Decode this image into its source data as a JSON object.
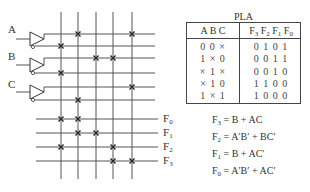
{
  "diagram": {
    "inputs": [
      {
        "name": "A",
        "label_x": 8,
        "label_y": 24,
        "line_y": 39,
        "true_y": 34,
        "comp_y": 46
      },
      {
        "name": "B",
        "label_x": 8,
        "label_y": 51,
        "line_y": 65,
        "true_y": 58,
        "comp_y": 73
      },
      {
        "name": "C",
        "label_x": 8,
        "label_y": 79,
        "line_y": 92,
        "true_y": 87,
        "comp_y": 100
      }
    ],
    "product_line_x": [
      61,
      78,
      96,
      113,
      132
    ],
    "input_line_ys": [
      34,
      46,
      58,
      73,
      87,
      100
    ],
    "and_crosses": [
      {
        "x": 78,
        "y": 34
      },
      {
        "x": 132,
        "y": 34
      },
      {
        "x": 61,
        "y": 46
      },
      {
        "x": 96,
        "y": 58
      },
      {
        "x": 113,
        "y": 58
      },
      {
        "x": 61,
        "y": 73
      },
      {
        "x": 132,
        "y": 87
      },
      {
        "x": 78,
        "y": 100
      }
    ],
    "outputs": [
      {
        "name": "F0",
        "base": "F",
        "sub": "0",
        "y": 119
      },
      {
        "name": "F1",
        "base": "F",
        "sub": "1",
        "y": 133
      },
      {
        "name": "F2",
        "base": "F",
        "sub": "2",
        "y": 147
      },
      {
        "name": "F3",
        "base": "F",
        "sub": "3",
        "y": 161
      }
    ],
    "or_crosses": [
      {
        "x": 61,
        "y": 119
      },
      {
        "x": 78,
        "y": 119
      },
      {
        "x": 78,
        "y": 133
      },
      {
        "x": 96,
        "y": 133
      },
      {
        "x": 61,
        "y": 147
      },
      {
        "x": 113,
        "y": 147
      },
      {
        "x": 113,
        "y": 161
      },
      {
        "x": 132,
        "y": 161
      }
    ]
  },
  "pla_table": {
    "title": "PLA",
    "input_header": "A B C",
    "output_header": {
      "F3": "F3",
      "F2": "F2",
      "F1": "F1",
      "F0": "F0"
    },
    "output_header_parts": [
      {
        "base": "F",
        "sub": "3"
      },
      {
        "base": "F",
        "sub": "2"
      },
      {
        "base": "F",
        "sub": "1"
      },
      {
        "base": "F",
        "sub": "0"
      }
    ],
    "rows": [
      {
        "inputs": "0 0 ×",
        "outputs": "0 1 0 1"
      },
      {
        "inputs": "1 × 0",
        "outputs": "0 0 1 1"
      },
      {
        "inputs": "× 1 ×",
        "outputs": "0 0 1 0"
      },
      {
        "inputs": "× 1 0",
        "outputs": "1 1 0 0"
      },
      {
        "inputs": "1 × 1",
        "outputs": "1 0 0 0"
      }
    ]
  },
  "equations": [
    {
      "lhs_base": "F",
      "lhs_sub": "3",
      "rhs": " = B + AC",
      "y": 114
    },
    {
      "lhs_base": "F",
      "lhs_sub": "2",
      "rhs": " = A′B′ + BC′",
      "y": 131
    },
    {
      "lhs_base": "F",
      "lhs_sub": "1",
      "rhs": " = B + AC′",
      "y": 148
    },
    {
      "lhs_base": "F",
      "lhs_sub": "0",
      "rhs": " = A′B′ + AC′",
      "y": 165
    }
  ],
  "colors": {
    "line": "#555555",
    "cross": "#222222",
    "text": "#333333",
    "background": "#ffffff"
  }
}
